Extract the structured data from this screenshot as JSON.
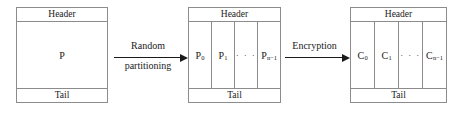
{
  "diagram": {
    "line_color": "#8c8c8c",
    "text_color": "#1a1a1a",
    "background": "#ffffff"
  },
  "boxes": [
    {
      "id": "plaintext-packet",
      "header_label": "Header",
      "tail_label": "Tail",
      "body_label": "P",
      "cells": []
    },
    {
      "id": "partitioned-packet",
      "header_label": "Header",
      "tail_label": "Tail",
      "body_label": "",
      "cells": [
        {
          "base": "P",
          "sub": "0"
        },
        {
          "base": "P",
          "sub": "1"
        },
        {
          "base": "· · ·",
          "sub": ""
        },
        {
          "base": "P",
          "sub": "n−1"
        }
      ]
    },
    {
      "id": "ciphertext-packet",
      "header_label": "Header",
      "tail_label": "Tail",
      "body_label": "",
      "cells": [
        {
          "base": "C",
          "sub": "0"
        },
        {
          "base": "C",
          "sub": "1"
        },
        {
          "base": "· · ·",
          "sub": ""
        },
        {
          "base": "C",
          "sub": "n−1"
        }
      ]
    }
  ],
  "arrows": [
    {
      "id": "random-partitioning-arrow",
      "label_top": "Random",
      "label_bottom": "partitioning"
    },
    {
      "id": "encryption-arrow",
      "label_top": "Encryption",
      "label_bottom": ""
    }
  ]
}
